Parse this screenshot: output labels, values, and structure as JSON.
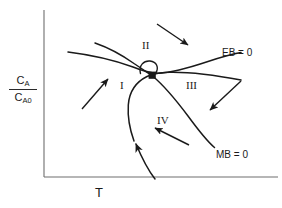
{
  "figure": {
    "name": "multiple-steady-states-diagram",
    "background_color": "#ffffff",
    "line_color": "#1a1a1a",
    "axis_color": "#6e6e6e"
  },
  "axes": {
    "x_label": "T",
    "y_label_numerator": "C",
    "y_label_numerator_sub": "A",
    "y_label_denominator": "C",
    "y_label_denominator_sub": "A0",
    "origin": [
      44,
      177
    ],
    "x_axis_end": [
      278,
      177
    ],
    "y_axis_top": [
      44,
      10
    ],
    "grid": false
  },
  "curves": [
    {
      "name": "energy-balance-curve",
      "label": "EB = 0",
      "label_position": [
        222,
        48
      ],
      "description": "rising curve from upper-left flattening to the right",
      "points": [
        [
          68,
          52
        ],
        [
          95,
          56
        ],
        [
          120,
          62
        ],
        [
          140,
          70
        ],
        [
          158,
          73
        ],
        [
          180,
          70
        ],
        [
          205,
          63
        ],
        [
          225,
          56
        ],
        [
          240,
          53
        ]
      ]
    },
    {
      "name": "mass-balance-curve",
      "label": "MB = 0",
      "label_position": [
        216,
        150
      ],
      "description": "descending curve from upper-right-of-center to lower right",
      "points": [
        [
          95,
          43
        ],
        [
          118,
          52
        ],
        [
          136,
          63
        ],
        [
          152,
          76
        ],
        [
          170,
          94
        ],
        [
          188,
          115
        ],
        [
          205,
          136
        ],
        [
          214,
          146
        ]
      ]
    },
    {
      "name": "lower-branch-curve",
      "label": "",
      "description": "rising branch from lower axis through intersection to upper right",
      "points": [
        [
          155,
          178
        ],
        [
          142,
          160
        ],
        [
          133,
          140
        ],
        [
          128,
          120
        ],
        [
          128,
          102
        ],
        [
          134,
          88
        ],
        [
          145,
          78
        ],
        [
          158,
          73
        ],
        [
          178,
          72
        ],
        [
          200,
          74
        ],
        [
          222,
          77
        ],
        [
          240,
          80
        ]
      ]
    }
  ],
  "markers": [
    {
      "name": "steady-state-point",
      "position": [
        152,
        75
      ],
      "style": "filled-square"
    },
    {
      "name": "intersection-loop",
      "position": [
        147,
        69
      ],
      "style": "small-open-loop"
    },
    {
      "name": "curve-direction-arrowhead",
      "position": [
        133,
        139
      ],
      "direction": "up"
    }
  ],
  "arrows": [
    {
      "name": "arrow-region-I",
      "from": [
        82,
        109
      ],
      "to": [
        109,
        78
      ],
      "points": "up-right"
    },
    {
      "name": "arrow-region-II",
      "from": [
        157,
        24
      ],
      "to": [
        189,
        46
      ],
      "points": "down-right"
    },
    {
      "name": "arrow-region-III",
      "from": [
        241,
        81
      ],
      "to": [
        209,
        111
      ],
      "points": "down-left"
    },
    {
      "name": "arrow-region-IV",
      "from": [
        189,
        145
      ],
      "to": [
        154,
        128
      ],
      "points": "up-left"
    }
  ],
  "region_labels": [
    {
      "name": "region-label-I",
      "text": "I",
      "position": [
        120,
        80
      ]
    },
    {
      "name": "region-label-II",
      "text": "II",
      "position": [
        142,
        40
      ]
    },
    {
      "name": "region-label-III",
      "text": "III",
      "position": [
        186,
        80
      ]
    },
    {
      "name": "region-label-IV",
      "text": "IV",
      "position": [
        157,
        115
      ]
    }
  ]
}
